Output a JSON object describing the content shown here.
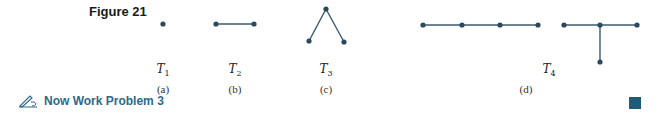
{
  "figure": {
    "title": "Figure 21",
    "colors": {
      "vertex": "#2c4a5e",
      "edge": "#3d5a6c",
      "accent": "#2a6a8c",
      "end_mark": "#1f5b78"
    },
    "trees": [
      {
        "name": "T",
        "sub": "1",
        "part": "(a)"
      },
      {
        "name": "T",
        "sub": "2",
        "part": "(b)"
      },
      {
        "name": "T",
        "sub": "3",
        "part": "(c)"
      },
      {
        "name": "T",
        "sub": "4",
        "part": "(d)"
      }
    ]
  },
  "footer": {
    "now_work_label": "Now Work Problem 3",
    "icon": "pencil-writing-icon"
  }
}
